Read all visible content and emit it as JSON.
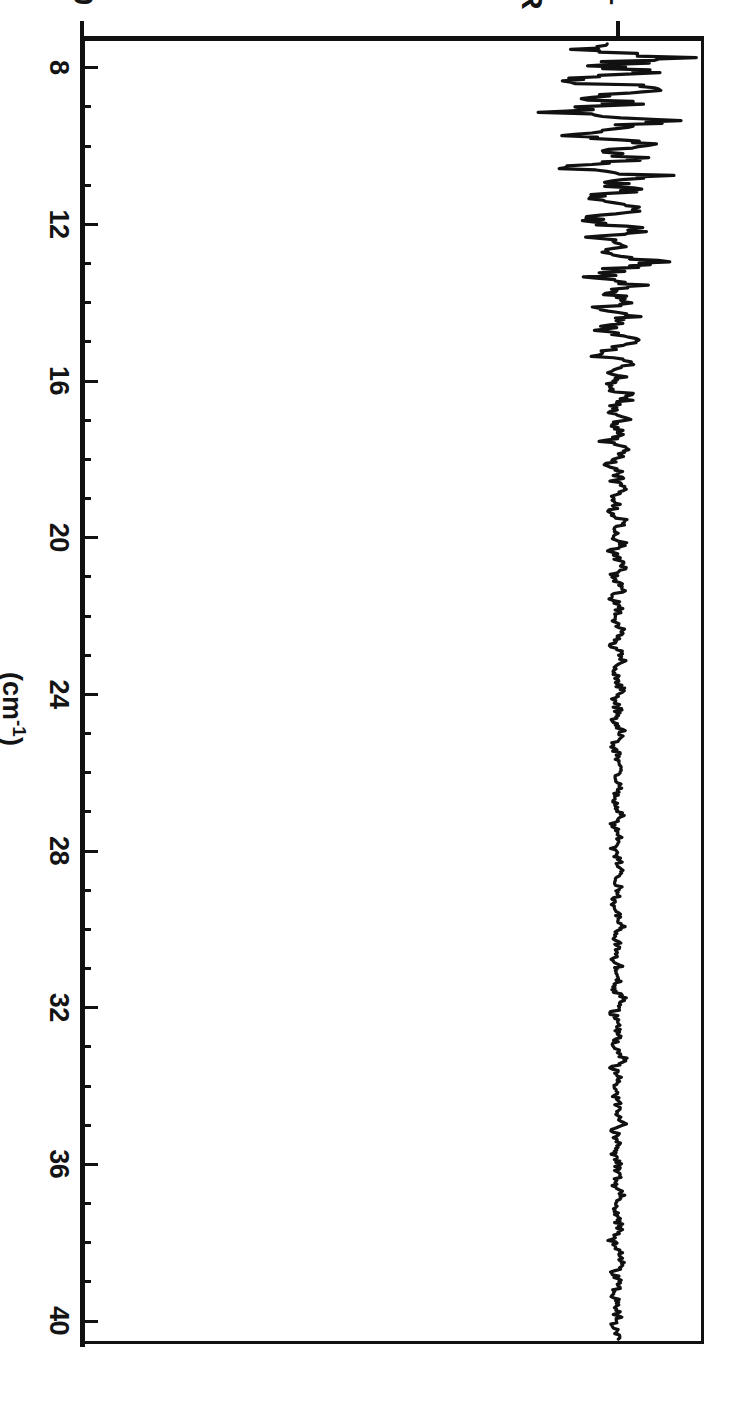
{
  "figure": {
    "rotation_degrees": 90,
    "background_color": "#ffffff",
    "ink_color": "#111111"
  },
  "axes": {
    "x": {
      "title": "(cm",
      "title_sup": "-1",
      "title_close": ")",
      "title_full": "(cm⁻¹)",
      "min": 7.2,
      "max": 40.6,
      "major_ticks": [
        8,
        12,
        16,
        20,
        24,
        28,
        32,
        36,
        40
      ],
      "major_labels": [
        "8",
        "12",
        "16",
        "20",
        "24",
        "28",
        "32",
        "36",
        "40"
      ],
      "minor_tick_step": 1
    },
    "y": {
      "title": "R",
      "min": 0,
      "max": 1.16,
      "ticks": [
        0,
        1
      ],
      "tick_labels": [
        "0",
        "1"
      ]
    }
  },
  "chart_data": {
    "type": "line",
    "title": "",
    "subtitle": "",
    "xlabel": "(cm⁻¹)",
    "ylabel": "R",
    "xlim": [
      7.2,
      40.6
    ],
    "ylim": [
      0,
      1.16
    ],
    "grid": false,
    "legend": null,
    "annotations": [],
    "series": [
      {
        "name": "R",
        "x": [
          7.3,
          7.5,
          7.7,
          7.9,
          8.1,
          8.3,
          8.5,
          8.7,
          8.9,
          9.1,
          9.3,
          9.5,
          9.7,
          9.9,
          10.1,
          10.3,
          10.5,
          10.7,
          10.9,
          11.1,
          11.3,
          11.5,
          11.7,
          11.9,
          12.1,
          12.3,
          12.5,
          12.7,
          12.9,
          13.1,
          13.3,
          13.5,
          13.7,
          13.9,
          14.1,
          14.3,
          14.5,
          14.7,
          14.9,
          15.1,
          15.3,
          15.5,
          15.7,
          15.9,
          16.1,
          16.3,
          16.5,
          16.7,
          16.9,
          17.1,
          17.3,
          17.5,
          17.7,
          17.9,
          18.1,
          18.3,
          18.5,
          18.7,
          18.9,
          19.1,
          19.3,
          19.5,
          19.7,
          19.9,
          20.1,
          20.3,
          20.5,
          20.7,
          20.9,
          21.1,
          21.3,
          21.5,
          21.7,
          21.9,
          22.1,
          22.3,
          22.5,
          22.7,
          22.9,
          23.1,
          23.3,
          23.5,
          23.7,
          23.9,
          24.1,
          24.3,
          24.5,
          24.7,
          24.9,
          25.1,
          25.3,
          25.5,
          25.7,
          25.9,
          26.1,
          26.3,
          26.5,
          26.7,
          26.9,
          27.1,
          27.3,
          27.5,
          27.7,
          27.9,
          28.1,
          28.3,
          28.5,
          28.7,
          28.9,
          29.1,
          29.3,
          29.5,
          29.7,
          29.9,
          30.1,
          30.3,
          30.5,
          30.7,
          30.9,
          31.1,
          31.3,
          31.5,
          31.7,
          31.9,
          32.1,
          32.3,
          32.5,
          32.7,
          32.9,
          33.1,
          33.3,
          33.5,
          33.7,
          33.9,
          34.1,
          34.3,
          34.5,
          34.7,
          34.9,
          35.1,
          35.3,
          35.5,
          35.7,
          35.9,
          36.1,
          36.3,
          36.5,
          36.7,
          36.9,
          37.1,
          37.3,
          37.5,
          37.7,
          37.9,
          38.1,
          38.3,
          38.5,
          38.7,
          38.9,
          39.1,
          39.3,
          39.5,
          39.7,
          39.9,
          40.1,
          40.3,
          40.5
        ],
        "y": [
          1.02,
          0.93,
          1.09,
          0.95,
          1.05,
          0.88,
          1.12,
          0.96,
          1.01,
          0.9,
          1.08,
          0.99,
          0.93,
          1.06,
          0.97,
          1.03,
          0.91,
          1.07,
          0.98,
          1.02,
          0.94,
          1.05,
          0.99,
          0.93,
          1.04,
          0.98,
          1.01,
          0.95,
          1.06,
          0.99,
          0.96,
          1.03,
          0.98,
          1.02,
          0.96,
          1.04,
          0.99,
          0.97,
          1.03,
          1.0,
          0.97,
          1.02,
          0.99,
          1.01,
          0.97,
          1.03,
          1.0,
          0.98,
          1.02,
          0.99,
          1.01,
          0.98,
          1.02,
          1.0,
          0.98,
          1.01,
          0.99,
          1.02,
          0.99,
          1.0,
          0.98,
          1.01,
          1.0,
          0.99,
          1.01,
          0.99,
          1.0,
          1.01,
          0.99,
          1.0,
          1.01,
          0.99,
          1.0,
          1.0,
          0.99,
          1.01,
          1.0,
          0.99,
          1.0,
          1.01,
          0.99,
          1.0,
          1.0,
          1.01,
          0.99,
          1.0,
          1.0,
          0.99,
          1.01,
          1.0,
          0.99,
          1.0,
          1.0,
          1.01,
          0.99,
          1.0,
          1.0,
          0.99,
          1.0,
          1.01,
          0.99,
          1.0,
          1.0,
          0.99,
          1.0,
          1.0,
          1.01,
          0.99,
          1.0,
          1.0,
          0.99,
          1.0,
          1.0,
          1.01,
          0.99,
          1.0,
          1.0,
          0.99,
          1.0,
          1.0,
          1.0,
          0.99,
          1.01,
          1.0,
          0.99,
          1.0,
          1.0,
          1.0,
          0.99,
          1.0,
          1.01,
          0.99,
          1.0,
          1.0,
          0.99,
          1.0,
          1.0,
          1.0,
          1.01,
          0.99,
          1.0,
          1.0,
          0.99,
          1.0,
          1.0,
          1.0,
          0.99,
          1.01,
          1.0,
          0.99,
          1.0,
          1.0,
          1.0,
          0.99,
          1.0,
          1.0,
          1.01,
          0.99,
          1.0,
          1.0,
          0.99,
          1.0,
          1.0,
          1.0,
          0.99,
          1.0,
          1.0
        ]
      }
    ]
  }
}
